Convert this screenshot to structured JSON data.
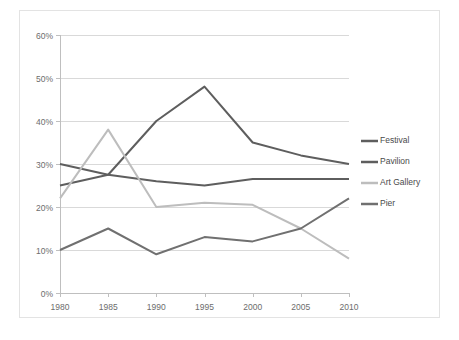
{
  "chart_data": {
    "type": "line",
    "title": "",
    "xlabel": "",
    "ylabel": "",
    "x": [
      1980,
      1985,
      1990,
      1995,
      2000,
      2005,
      2010
    ],
    "categories": [
      "1980",
      "1985",
      "1990",
      "1995",
      "2000",
      "2005",
      "2010"
    ],
    "xtick_labels": [
      "1980",
      "1985",
      "1990",
      "1995",
      "2000",
      "2005",
      "2010"
    ],
    "ytick_labels": [
      "0%",
      "10%",
      "20%",
      "30%",
      "40%",
      "50%",
      "60%"
    ],
    "ytick_values": [
      0,
      10,
      20,
      30,
      40,
      50,
      60
    ],
    "ylim": [
      0,
      60
    ],
    "xlim": [
      1980,
      2010
    ],
    "yunit": "%",
    "grid": true,
    "legend_position": "right",
    "series": [
      {
        "name": "Festival",
        "color": "#5e5e5e",
        "values": [
          25,
          27.5,
          40,
          48,
          35,
          32,
          30
        ]
      },
      {
        "name": "Pavilion",
        "color": "#5e5e5e",
        "values": [
          30,
          27.5,
          26,
          25,
          26.5,
          26.5,
          26.5
        ]
      },
      {
        "name": "Art Gallery",
        "color": "#bdbdbd",
        "values": [
          22,
          38,
          20,
          21,
          20.5,
          15,
          8
        ]
      },
      {
        "name": "Pier",
        "color": "#707070",
        "values": [
          10,
          15,
          9,
          13,
          12,
          15,
          22
        ]
      }
    ]
  },
  "legend": {
    "items": [
      {
        "label": "Festival"
      },
      {
        "label": "Pavilion"
      },
      {
        "label": "Art Gallery"
      },
      {
        "label": "Pier"
      }
    ]
  },
  "colors": {
    "background": "#ffffff",
    "border": "#e3e3e3",
    "gridline": "#d9d9d9",
    "axis": "#bfbfbf",
    "tick_label": "#6d6d6d",
    "legend_label": "#4a4a4a"
  }
}
